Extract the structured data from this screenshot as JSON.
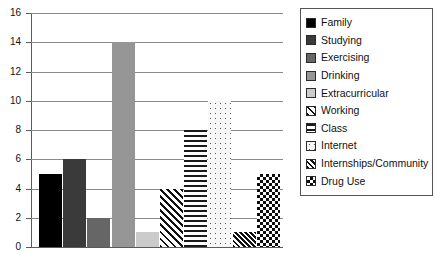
{
  "chart_data": {
    "type": "bar",
    "title": "",
    "subtitle": "",
    "xlabel": "",
    "ylabel": "",
    "ylim": [
      0,
      16
    ],
    "ytick_step": 2,
    "yticks": [
      "0",
      "2",
      "4",
      "6",
      "8",
      "10",
      "12",
      "14",
      "16"
    ],
    "grid": "horizontal",
    "xtick_labels": [],
    "legend_position": "right",
    "categories": [
      "Family",
      "Studying",
      "Exercising",
      "Drinking",
      "Extracurricular",
      "Working",
      "Class",
      "Internet",
      "Internships/Community",
      "Drug Use"
    ],
    "values": [
      5,
      6,
      2,
      14,
      1,
      4,
      8,
      10,
      1,
      5
    ],
    "series": [
      {
        "name": "Hours",
        "values": [
          5,
          6,
          2,
          14,
          1,
          4,
          8,
          10,
          1,
          5
        ]
      }
    ],
    "bar_fills": [
      "solid-black",
      "solid-dark-gray",
      "solid-medium-gray",
      "solid-gray",
      "solid-light-gray",
      "diagonal-hatch",
      "horizontal-lines",
      "sparse-dots",
      "dense-diagonal-hatch",
      "checkerboard"
    ],
    "colors": {
      "solid-black": "#000000",
      "solid-dark-gray": "#3a3a3a",
      "solid-medium-gray": "#666666",
      "solid-gray": "#969696",
      "solid-light-gray": "#cbcbcb",
      "pattern-ink": "#111111",
      "background": "#ffffff",
      "axis": "#5a5a5a",
      "gridline": "#8a8a8a"
    }
  },
  "legend": {
    "items": [
      {
        "label": "Family",
        "fill": "solid-black"
      },
      {
        "label": "Studying",
        "fill": "solid-dark-gray"
      },
      {
        "label": "Exercising",
        "fill": "solid-medium-gray"
      },
      {
        "label": "Drinking",
        "fill": "solid-gray"
      },
      {
        "label": "Extracurricular",
        "fill": "solid-light-gray"
      },
      {
        "label": "Working",
        "fill": "diagonal-hatch"
      },
      {
        "label": "Class",
        "fill": "horizontal-lines"
      },
      {
        "label": "Internet",
        "fill": "sparse-dots"
      },
      {
        "label": "Internships/Community",
        "fill": "dense-diagonal-hatch"
      },
      {
        "label": "Drug Use",
        "fill": "checkerboard"
      }
    ]
  }
}
